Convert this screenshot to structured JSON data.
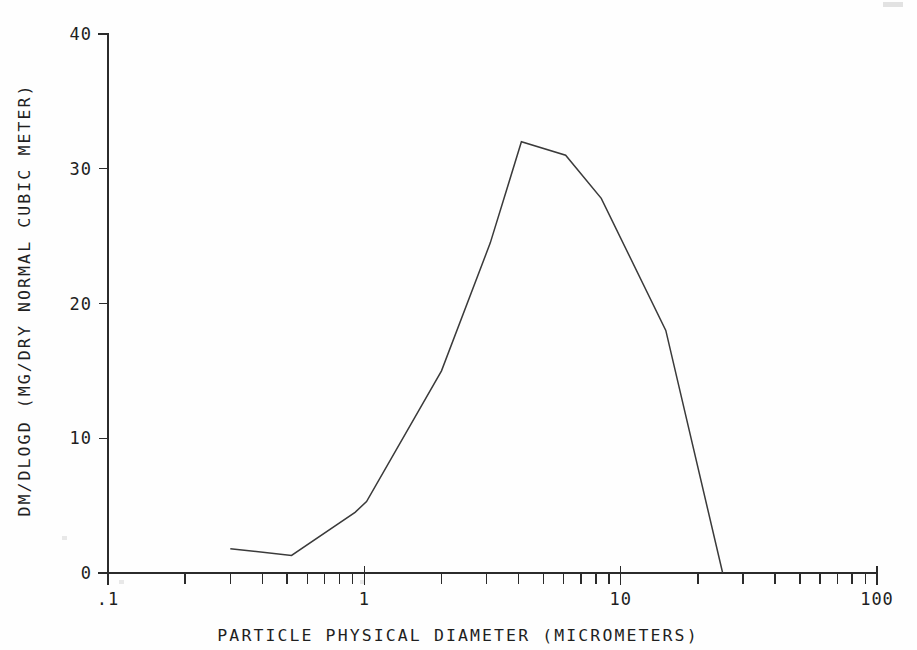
{
  "chart_data": {
    "type": "line",
    "title": "",
    "subtitle": "",
    "xlabel": "PARTICLE PHYSICAL DIAMETER (MICROMETERS)",
    "ylabel": "DM/DLOGD (MG/DRY NORMAL CUBIC METER)",
    "xscale": "log",
    "yscale": "linear",
    "xlim": [
      0.1,
      100
    ],
    "ylim": [
      0,
      40
    ],
    "grid": false,
    "legend": false,
    "legend_position": "none",
    "x_tick_labels": [
      ".1",
      "1",
      "10",
      "100"
    ],
    "x_tick_values": [
      0.1,
      1,
      10,
      100
    ],
    "x_minor_ticks": true,
    "y_tick_labels": [
      "0",
      "10",
      "20",
      "30",
      "40"
    ],
    "y_tick_values": [
      0,
      10,
      20,
      30,
      40
    ],
    "series": [
      {
        "name": "mass distribution",
        "x": [
          0.3,
          0.52,
          0.92,
          1.02,
          2.0,
          3.1,
          4.1,
          6.1,
          8.4,
          15.0,
          25.0
        ],
        "y": [
          1.8,
          1.3,
          4.5,
          5.3,
          15.0,
          24.5,
          32.0,
          31.0,
          27.8,
          18.0,
          0.0
        ]
      }
    ],
    "annotations": []
  },
  "axes": {
    "x_axis_name": "x-axis",
    "y_axis_name": "y-axis"
  },
  "colors": {
    "line": "#3a3a3a",
    "axis": "#2b2b2b",
    "text": "#1f1f1f",
    "background": "#fefefe"
  }
}
